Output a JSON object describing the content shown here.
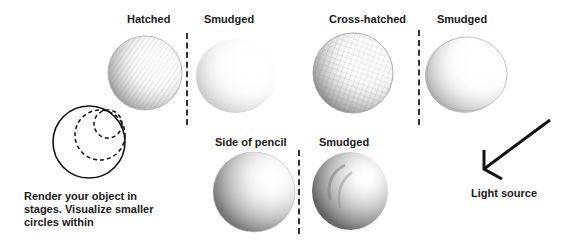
{
  "labels": {
    "hatched": "Hatched",
    "smudged_1": "Smudged",
    "cross_hatched": "Cross-hatched",
    "smudged_2": "Smudged",
    "side_of_pencil": "Side of pencil",
    "smudged_3": "Smudged",
    "light_source": "Light source"
  },
  "caption": {
    "line1": "Render your object in",
    "line2": "stages. Visualize smaller",
    "line3": "circles within"
  },
  "colors": {
    "ink": "#1a1a1a",
    "pencil_dark": "#7a7a7a",
    "pencil_light": "#cfcfcf"
  }
}
